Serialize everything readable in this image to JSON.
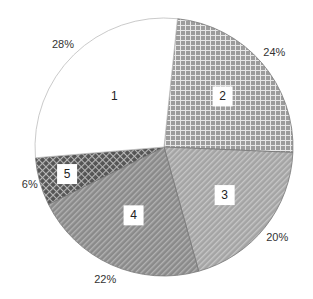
{
  "chart_data": {
    "type": "pie",
    "title": "",
    "categories": [
      "1",
      "2",
      "3",
      "4",
      "5"
    ],
    "values": [
      28,
      24,
      20,
      22,
      6
    ],
    "value_labels": [
      "28%",
      "24%",
      "20%",
      "22%",
      "6%"
    ],
    "legend": "none",
    "start_angle_deg": 6,
    "direction": "clockwise",
    "slice_order": [
      "2",
      "3",
      "4",
      "5",
      "1"
    ],
    "fills": {
      "1": {
        "pattern": "solid",
        "color": "#ffffff"
      },
      "2": {
        "pattern": "grid",
        "color": "#9a9a9a"
      },
      "3": {
        "pattern": "diagonal-stripes",
        "color": "#a8a8a8"
      },
      "4": {
        "pattern": "diagonal-stripes",
        "color": "#8a8a8a"
      },
      "5": {
        "pattern": "diamond-crosshatch",
        "color": "#6a6a6a"
      }
    }
  }
}
